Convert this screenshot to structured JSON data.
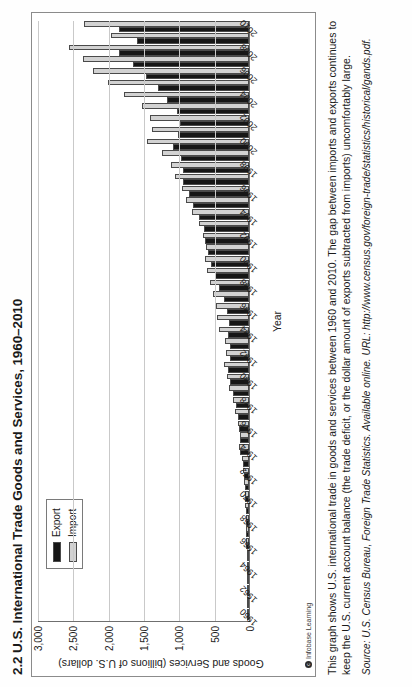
{
  "page": {
    "title": "2.2 U.S. International Trade Goods and Services, 1960–2010",
    "credit": "Infobase Learning",
    "credit_mark": "c"
  },
  "caption": {
    "text": "This graph shows U.S. international trade in goods and services between 1960 and 2010. The gap between imports and exports continues to keep the U.S. current account balance (the trade deficit, or the dollar amount of exports subtracted from imports) uncomfortably large."
  },
  "source": {
    "text": "Source: U.S. Census Bureau, Foreign Trade Statistics.  Available online. URL: http://www.census.gov/foreign-trade/statistics/historical/gands.pdf."
  },
  "legend": {
    "export_label": "Export",
    "import_label": "Import",
    "export_color": "#161616",
    "import_color": "#d2d2d2"
  },
  "chart_data": {
    "type": "bar",
    "title": "2.2 U.S. International Trade Goods and Services, 1960–2010",
    "xlabel": "Year",
    "ylabel": "Goods and Services (billions of U.S. dollars)",
    "ylim": [
      0,
      3000
    ],
    "yticks": [
      "0",
      "500",
      "1,000",
      "1,500",
      "2,000",
      "2,500",
      "3,000"
    ],
    "ytick_values": [
      0,
      500,
      1000,
      1500,
      2000,
      2500,
      3000
    ],
    "grid": true,
    "legend_position": "upper-left",
    "categories": [
      "1960",
      "1961",
      "1962",
      "1963",
      "1964",
      "1965",
      "1966",
      "1967",
      "1968",
      "1969",
      "1970",
      "1971",
      "1972",
      "1973",
      "1974",
      "1975",
      "1976",
      "1977",
      "1978",
      "1979",
      "1980",
      "1981",
      "1982",
      "1983",
      "1984",
      "1985",
      "1986",
      "1987",
      "1988",
      "1989",
      "1990",
      "1991",
      "1992",
      "1993",
      "1994",
      "1995",
      "1996",
      "1997",
      "1998",
      "1999",
      "2000",
      "2001",
      "2002",
      "2003",
      "2004",
      "2005",
      "2006",
      "2007",
      "2008",
      "2009",
      "2010"
    ],
    "tick_categories": [
      "1960",
      "1962",
      "1964",
      "1966",
      "1968",
      "1970",
      "1972",
      "1974",
      "1976",
      "1978",
      "1980",
      "1982",
      "1984",
      "1986",
      "1988",
      "1990",
      "1992",
      "1994",
      "1996",
      "1998",
      "2000",
      "2002",
      "2004",
      "2006",
      "2008",
      "2010"
    ],
    "series": [
      {
        "name": "Export",
        "color": "#161616",
        "values": [
          26,
          26,
          27,
          29,
          33,
          35,
          38,
          41,
          45,
          49,
          57,
          59,
          67,
          91,
          121,
          133,
          143,
          153,
          180,
          225,
          272,
          294,
          275,
          266,
          291,
          289,
          310,
          349,
          431,
          487,
          535,
          578,
          617,
          643,
          703,
          795,
          852,
          938,
          933,
          966,
          1071,
          1005,
          978,
          1018,
          1160,
          1283,
          1457,
          1646,
          1843,
          1579,
          1838
        ]
      },
      {
        "name": "Import",
        "color": "#d2d2d2",
        "values": [
          22,
          22,
          25,
          26,
          28,
          32,
          38,
          41,
          49,
          54,
          59,
          66,
          79,
          98,
          137,
          133,
          162,
          194,
          230,
          282,
          317,
          348,
          330,
          342,
          426,
          450,
          471,
          511,
          553,
          590,
          616,
          609,
          657,
          714,
          801,
          891,
          955,
          1042,
          1099,
          1231,
          1450,
          1369,
          1398,
          1513,
          1770,
          1997,
          2212,
          2352,
          2541,
          1959,
          2338
        ]
      }
    ]
  }
}
